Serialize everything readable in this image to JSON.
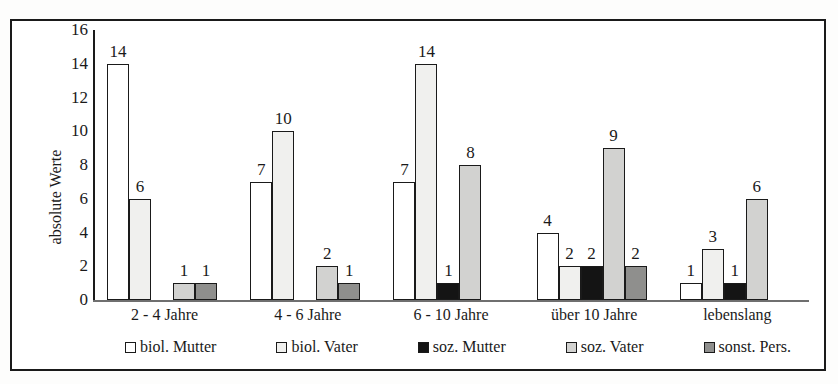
{
  "figure": {
    "title_sliver": "",
    "y_axis_title": "absolute Werte"
  },
  "chart_data": {
    "type": "bar",
    "title": "",
    "xlabel": "",
    "ylabel": "absolute Werte",
    "ylim": [
      0,
      16
    ],
    "yticks": [
      "0",
      "2",
      "4",
      "6",
      "8",
      "10",
      "12",
      "14",
      "16"
    ],
    "grid": false,
    "legend_position": "bottom",
    "categories": [
      "2 - 4 Jahre",
      "4 - 6 Jahre",
      "6 - 10 Jahre",
      "über 10 Jahre",
      "lebenslang"
    ],
    "series": [
      {
        "name": "biol. Mutter",
        "color": "#ffffff",
        "values": [
          14,
          7,
          7,
          4,
          1
        ],
        "labels": [
          "14",
          "7",
          "7",
          "4",
          "1"
        ]
      },
      {
        "name": "biol. Vater",
        "color": "#f0f0ee",
        "values": [
          6,
          10,
          14,
          2,
          3
        ],
        "labels": [
          "6",
          "10",
          "14",
          "2",
          "3"
        ]
      },
      {
        "name": "soz. Mutter",
        "color": "#141414",
        "values": [
          0,
          0,
          1,
          2,
          1
        ],
        "labels": [
          "",
          "",
          "1",
          "2",
          "1"
        ]
      },
      {
        "name": "soz. Vater",
        "color": "#d2d2d0",
        "values": [
          1,
          2,
          8,
          9,
          6
        ],
        "labels": [
          "1",
          "2",
          "8",
          "9",
          "6"
        ]
      },
      {
        "name": "sonst. Pers.",
        "color": "#8f8f8d",
        "values": [
          1,
          1,
          0,
          2,
          0
        ],
        "labels": [
          "1",
          "1",
          "",
          "2",
          ""
        ]
      }
    ]
  },
  "legend": {
    "items": [
      {
        "label": "biol. Mutter",
        "color": "#ffffff"
      },
      {
        "label": "biol. Vater",
        "color": "#f0f0ee"
      },
      {
        "label": "soz. Mutter",
        "color": "#141414"
      },
      {
        "label": "soz. Vater",
        "color": "#d2d2d0"
      },
      {
        "label": "sonst. Pers.",
        "color": "#8f8f8d"
      }
    ]
  }
}
